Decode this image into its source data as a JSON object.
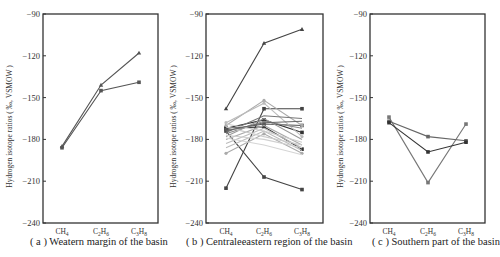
{
  "chart_data": [
    {
      "type": "line",
      "panel": "a",
      "caption": "( a ) Weatern margin of the basin",
      "ylabel": "Hydrogen isotope ratios ( ‰, VSMOW )",
      "xlabel": "",
      "categories": [
        "CH4",
        "C2H6",
        "C3H8"
      ],
      "category_labels": [
        [
          "CH",
          "4"
        ],
        [
          "C",
          "2",
          "H",
          "6"
        ],
        [
          "C",
          "3",
          "H",
          "8"
        ]
      ],
      "ylim": [
        -240,
        -90
      ],
      "yticks": [
        -90,
        -120,
        -150,
        -180,
        -210,
        -240
      ],
      "grid": false,
      "series": [
        {
          "name": "sample-1",
          "values": [
            -185,
            -141,
            -118
          ],
          "color": "#555555",
          "marker": "triangle"
        },
        {
          "name": "sample-2",
          "values": [
            -186,
            -145,
            -139
          ],
          "color": "#555555",
          "marker": "square"
        }
      ]
    },
    {
      "type": "line",
      "panel": "b",
      "caption": "( b ) Centraleeastern region of the basin",
      "ylabel": "Hydrogen isotope ratios ( ‰, VSMOW )",
      "xlabel": "",
      "categories": [
        "CH4",
        "C2H6",
        "C3H8"
      ],
      "category_labels": [
        [
          "CH",
          "4"
        ],
        [
          "C",
          "2",
          "H",
          "6"
        ],
        [
          "C",
          "3",
          "H",
          "8"
        ]
      ],
      "ylim": [
        -240,
        -90
      ],
      "yticks": [
        -90,
        -120,
        -150,
        -180,
        -210,
        -240
      ],
      "grid": false,
      "series": [
        {
          "name": "s1",
          "values": [
            -158,
            -111,
            -101
          ],
          "color": "#444444",
          "marker": "triangle"
        },
        {
          "name": "s2",
          "values": [
            -215,
            -158,
            -158
          ],
          "color": "#444444",
          "marker": "square"
        },
        {
          "name": "s3",
          "values": [
            -174,
            -207,
            -216
          ],
          "color": "#444444",
          "marker": "square"
        },
        {
          "name": "s4",
          "values": [
            -172,
            -166,
            -175
          ],
          "color": "#333333",
          "marker": "square"
        },
        {
          "name": "s5",
          "values": [
            -172,
            -171,
            -187
          ],
          "color": "#333333",
          "marker": "square"
        },
        {
          "name": "s6",
          "values": [
            -173,
            -169,
            -170
          ],
          "color": "#555555",
          "marker": "square"
        },
        {
          "name": "s7",
          "values": [
            -170,
            -152,
            -170
          ],
          "color": "#aaaaaa",
          "marker": "circle"
        },
        {
          "name": "s8",
          "values": [
            -168,
            -154,
            -178
          ],
          "color": "#bbbbbb",
          "marker": "circle"
        },
        {
          "name": "s9",
          "values": [
            -175,
            -163,
            -165
          ],
          "color": "#777777",
          "marker": "none"
        },
        {
          "name": "s10",
          "values": [
            -176,
            -167,
            -172
          ],
          "color": "#888888",
          "marker": "none"
        },
        {
          "name": "s11",
          "values": [
            -178,
            -165,
            -180
          ],
          "color": "#999999",
          "marker": "none"
        },
        {
          "name": "s12",
          "values": [
            -180,
            -170,
            -184
          ],
          "color": "#aaaaaa",
          "marker": "none"
        },
        {
          "name": "s13",
          "values": [
            -183,
            -172,
            -186
          ],
          "color": "#bbbbbb",
          "marker": "none"
        },
        {
          "name": "s14",
          "values": [
            -186,
            -174,
            -188
          ],
          "color": "#bbbbbb",
          "marker": "none"
        },
        {
          "name": "s15",
          "values": [
            -190,
            -176,
            -190
          ],
          "color": "#aaaaaa",
          "marker": "circle"
        },
        {
          "name": "s16",
          "values": [
            -169,
            -174,
            -182
          ],
          "color": "#cccccc",
          "marker": "none"
        },
        {
          "name": "s17",
          "values": [
            -171,
            -178,
            -184
          ],
          "color": "#cccccc",
          "marker": "none"
        },
        {
          "name": "s18",
          "values": [
            -177,
            -180,
            -186
          ],
          "color": "#d0d0d0",
          "marker": "none"
        },
        {
          "name": "s19",
          "values": [
            -179,
            -184,
            -191
          ],
          "color": "#d5d5d5",
          "marker": "none"
        },
        {
          "name": "s20",
          "values": [
            -174,
            -168,
            -167
          ],
          "color": "#666666",
          "marker": "none"
        }
      ]
    },
    {
      "type": "line",
      "panel": "c",
      "caption": "( c ) Southern part of the basin",
      "ylabel": "Hydrogen isotope ratios ( ‰, VSMOW )",
      "xlabel": "",
      "categories": [
        "CH4",
        "C2H6",
        "C3H8"
      ],
      "category_labels": [
        [
          "CH",
          "4"
        ],
        [
          "C",
          "2",
          "H",
          "6"
        ],
        [
          "C",
          "3",
          "H",
          "8"
        ]
      ],
      "ylim": [
        -240,
        -90
      ],
      "yticks": [
        -90,
        -120,
        -150,
        -180,
        -210,
        -240
      ],
      "grid": false,
      "series": [
        {
          "name": "sample-1",
          "values": [
            -164,
            -211,
            -169
          ],
          "color": "#777777",
          "marker": "square"
        },
        {
          "name": "sample-2",
          "values": [
            -167,
            -178,
            -181
          ],
          "color": "#666666",
          "marker": "square"
        },
        {
          "name": "sample-3",
          "values": [
            -168,
            -189,
            -182
          ],
          "color": "#333333",
          "marker": "square"
        }
      ]
    }
  ],
  "layout": {
    "panels": [
      {
        "left": 43,
        "right": 158,
        "top": 14,
        "bottom": 223,
        "xs": [
          62,
          101,
          139
        ],
        "caption_x": 30,
        "ylabel_x": 12
      },
      {
        "left": 206,
        "right": 323,
        "top": 14,
        "bottom": 223,
        "xs": [
          226,
          264,
          302
        ],
        "caption_x": 188,
        "ylabel_x": 176
      },
      {
        "left": 370,
        "right": 485,
        "top": 14,
        "bottom": 223,
        "xs": [
          389,
          428,
          466
        ],
        "caption_x": 372,
        "ylabel_x": 343
      }
    ]
  }
}
